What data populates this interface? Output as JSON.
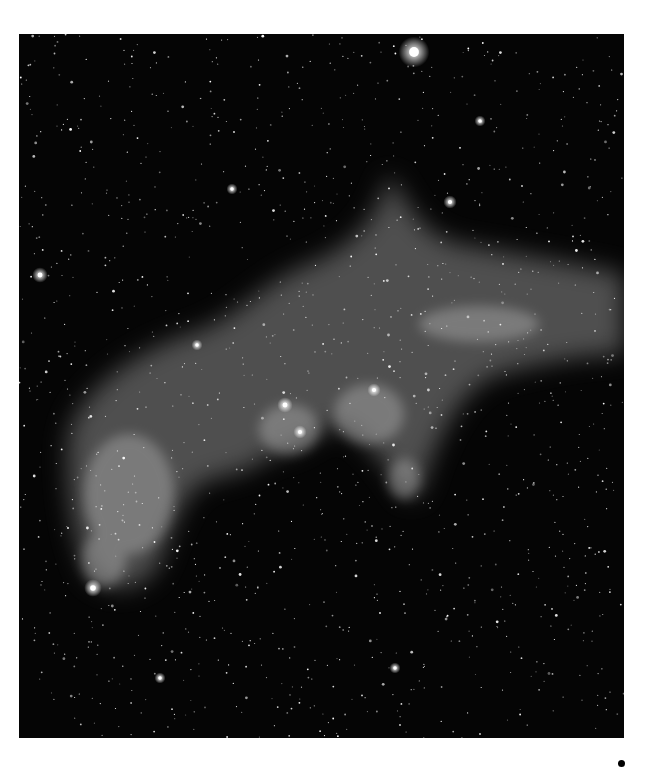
{
  "image": {
    "subject": "nebula-astrophotograph",
    "colors": {
      "sky": "#050505",
      "nebula": "#9a9a9a",
      "page": "#ffffff",
      "dot": "#000000"
    },
    "bright_stars": [
      {
        "x": 395,
        "y": 18,
        "r": 7
      },
      {
        "x": 21,
        "y": 241,
        "r": 3.5
      },
      {
        "x": 74,
        "y": 554,
        "r": 4
      },
      {
        "x": 266,
        "y": 371,
        "r": 3.5
      },
      {
        "x": 281,
        "y": 398,
        "r": 3
      },
      {
        "x": 431,
        "y": 168,
        "r": 3
      },
      {
        "x": 376,
        "y": 634,
        "r": 2.5
      },
      {
        "x": 141,
        "y": 644,
        "r": 2.5
      },
      {
        "x": 178,
        "y": 311,
        "r": 2.5
      },
      {
        "x": 355,
        "y": 356,
        "r": 3
      },
      {
        "x": 213,
        "y": 155,
        "r": 2.5
      },
      {
        "x": 461,
        "y": 87,
        "r": 2.5
      }
    ]
  },
  "marker": {
    "shape": "dot"
  }
}
